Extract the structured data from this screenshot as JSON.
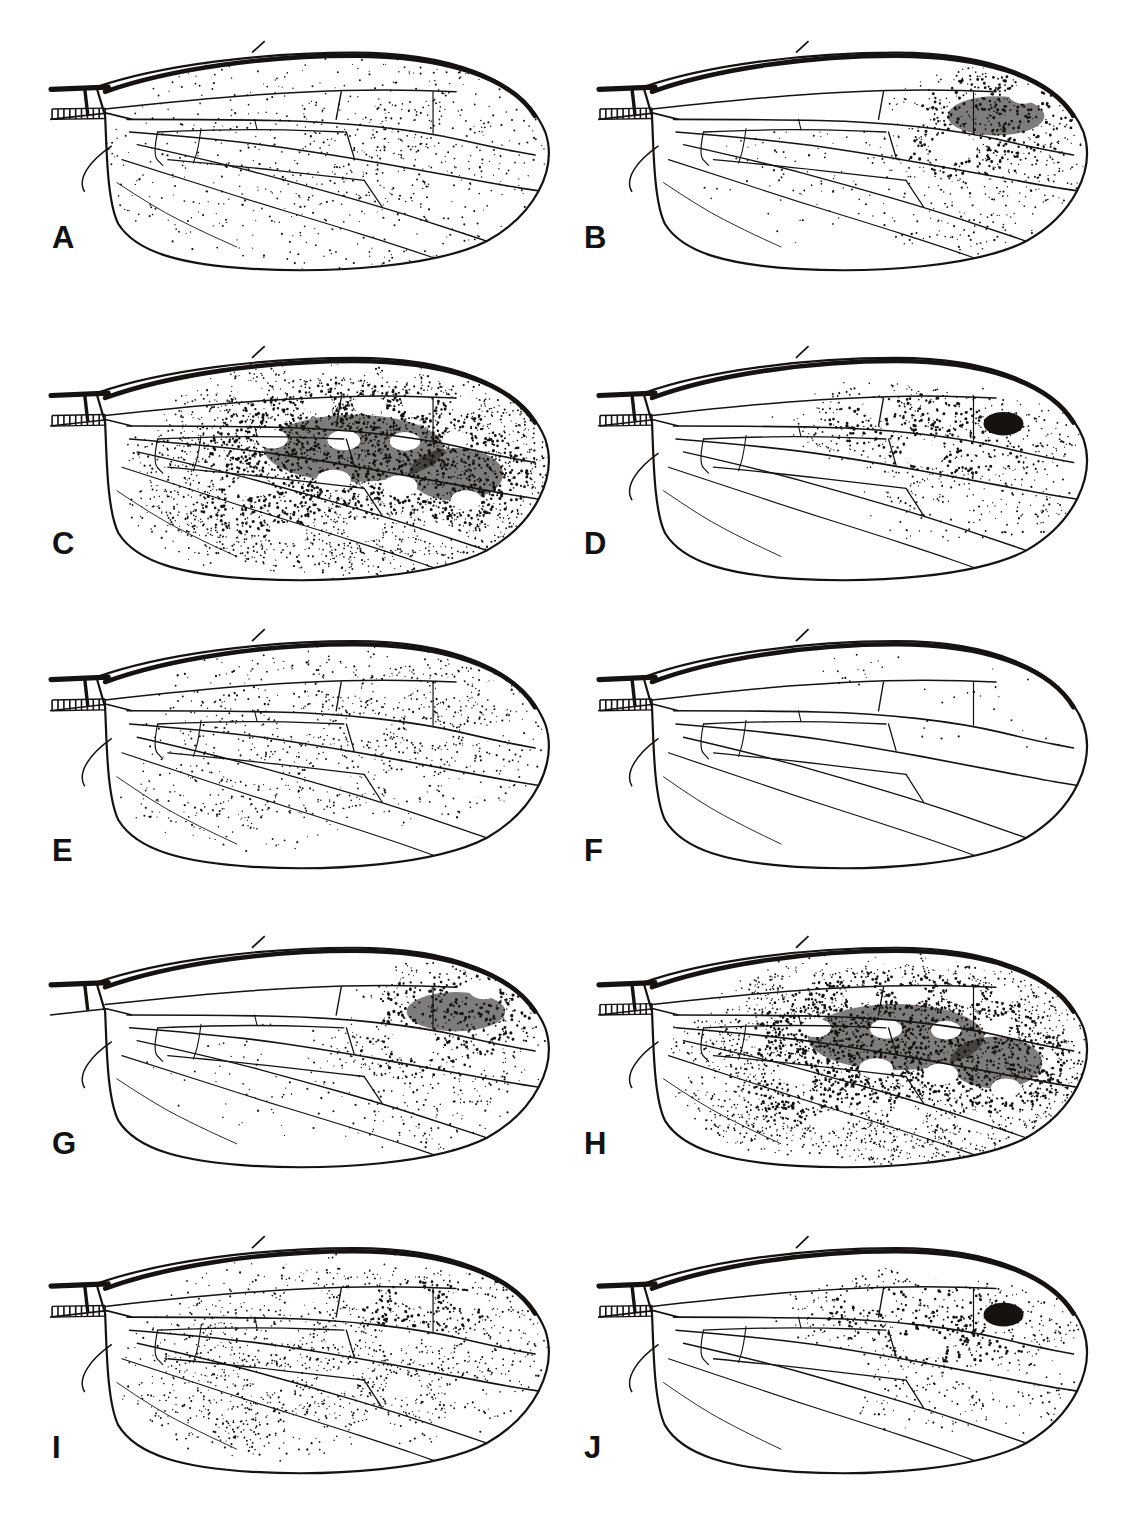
{
  "plate": {
    "title": "Wing pattern plate",
    "background_color": "#ffffff",
    "ink_color": "#15120f",
    "columns": 2,
    "rows": 5,
    "panel_count": 10
  },
  "figure_type": "scientific-illustration-plate",
  "panels": [
    {
      "label": "A",
      "row": 1,
      "column": 1,
      "x": 48,
      "y": 40,
      "w": 510,
      "h": 230,
      "label_x": 52,
      "label_y": 222,
      "pattern": "diffuse-fine-stipple",
      "stipple_density": 0.22,
      "stipple_seed": 11,
      "dark_blotches": 0,
      "solid_black_spot": false,
      "hyaline_windows": 0,
      "costal_bar": true,
      "basal_ladder": true,
      "alula_lobe": true,
      "description": "Wing evenly speckled with fine scattered dots; no defined dark bands or clear windows."
    },
    {
      "label": "B",
      "row": 1,
      "column": 2,
      "x": 596,
      "y": 40,
      "w": 500,
      "h": 230,
      "label_x": 584,
      "label_y": 222,
      "pattern": "apical-dark-mass",
      "stipple_density": 0.3,
      "stipple_seed": 23,
      "dark_blotches": 1,
      "solid_black_spot": false,
      "hyaline_windows": 3,
      "costal_bar": true,
      "basal_ladder": true,
      "alula_lobe": true,
      "description": "Dense dark pigment mass in apical third with rounded clear windows; base sparsely dotted."
    },
    {
      "label": "C",
      "row": 2,
      "column": 1,
      "x": 48,
      "y": 345,
      "w": 510,
      "h": 235,
      "label_x": 52,
      "label_y": 528,
      "pattern": "heavily-maculate",
      "stipple_density": 0.72,
      "stipple_seed": 37,
      "dark_blotches": 4,
      "solid_black_spot": false,
      "hyaline_windows": 16,
      "costal_bar": true,
      "basal_ladder": true,
      "alula_lobe": false,
      "description": "Wing almost entirely dark-stippled with numerous large rounded hyaline windows throughout."
    },
    {
      "label": "D",
      "row": 2,
      "column": 2,
      "x": 596,
      "y": 345,
      "w": 500,
      "h": 235,
      "label_x": 584,
      "label_y": 528,
      "pattern": "central-band-with-black-spot",
      "stipple_density": 0.34,
      "stipple_seed": 41,
      "dark_blotches": 2,
      "solid_black_spot": true,
      "hyaline_windows": 6,
      "costal_bar": true,
      "basal_ladder": true,
      "alula_lobe": true,
      "description": "Dark stippled band across mid-wing containing one solid black rounded spot; basal half hyaline."
    },
    {
      "label": "E",
      "row": 3,
      "column": 1,
      "x": 48,
      "y": 628,
      "w": 510,
      "h": 240,
      "label_x": 52,
      "label_y": 835,
      "pattern": "reticulate-pale",
      "stipple_density": 0.42,
      "stipple_seed": 53,
      "dark_blotches": 0,
      "solid_black_spot": false,
      "hyaline_windows": 18,
      "costal_bar": true,
      "basal_ladder": true,
      "alula_lobe": true,
      "description": "Evenly reticulate mid-tone stippling forming a net of pale rounded cells across whole wing."
    },
    {
      "label": "F",
      "row": 3,
      "column": 2,
      "x": 596,
      "y": 628,
      "w": 500,
      "h": 240,
      "label_x": 584,
      "label_y": 835,
      "pattern": "nearly-hyaline",
      "stipple_density": 0.06,
      "stipple_seed": 67,
      "dark_blotches": 0,
      "solid_black_spot": false,
      "hyaline_windows": 0,
      "costal_bar": true,
      "basal_ladder": true,
      "alula_lobe": true,
      "description": "Wing almost entirely clear; only faint sparse flecks along anterior and apical cells."
    },
    {
      "label": "G",
      "row": 4,
      "column": 1,
      "x": 48,
      "y": 935,
      "w": 510,
      "h": 232,
      "label_x": 52,
      "label_y": 1128,
      "pattern": "apical-dark-mass",
      "stipple_density": 0.26,
      "stipple_seed": 71,
      "dark_blotches": 1,
      "solid_black_spot": false,
      "hyaline_windows": 4,
      "costal_bar": true,
      "basal_ladder": false,
      "alula_lobe": true,
      "description": "Basal half clear, apical half with heavy dark stipple and a few round clear windows."
    },
    {
      "label": "H",
      "row": 4,
      "column": 2,
      "x": 596,
      "y": 935,
      "w": 500,
      "h": 232,
      "label_x": 584,
      "label_y": 1128,
      "pattern": "heavily-maculate",
      "stipple_density": 0.7,
      "stipple_seed": 83,
      "dark_blotches": 3,
      "solid_black_spot": false,
      "hyaline_windows": 14,
      "costal_bar": true,
      "basal_ladder": true,
      "alula_lobe": true,
      "description": "Broad dense dark pigment over most of wing with large irregular hyaline windows; hatched basal cell."
    },
    {
      "label": "I",
      "row": 5,
      "column": 1,
      "x": 48,
      "y": 1235,
      "w": 510,
      "h": 238,
      "label_x": 52,
      "label_y": 1432,
      "pattern": "reticulate-mid",
      "stipple_density": 0.48,
      "stipple_seed": 97,
      "dark_blotches": 1,
      "solid_black_spot": false,
      "hyaline_windows": 15,
      "costal_bar": true,
      "basal_ladder": true,
      "alula_lobe": true,
      "description": "Mid-density reticulate stippling over entire wing with many rounded pale windows."
    },
    {
      "label": "J",
      "row": 5,
      "column": 2,
      "x": 596,
      "y": 1235,
      "w": 500,
      "h": 238,
      "label_x": 584,
      "label_y": 1432,
      "pattern": "central-band-with-black-spot",
      "stipple_density": 0.3,
      "stipple_seed": 103,
      "dark_blotches": 2,
      "solid_black_spot": true,
      "hyaline_windows": 5,
      "costal_bar": true,
      "basal_ladder": true,
      "alula_lobe": true,
      "description": "Dark stippled band along mid-wing with a solid black rounded spot; posterior and basal areas clear."
    }
  ]
}
